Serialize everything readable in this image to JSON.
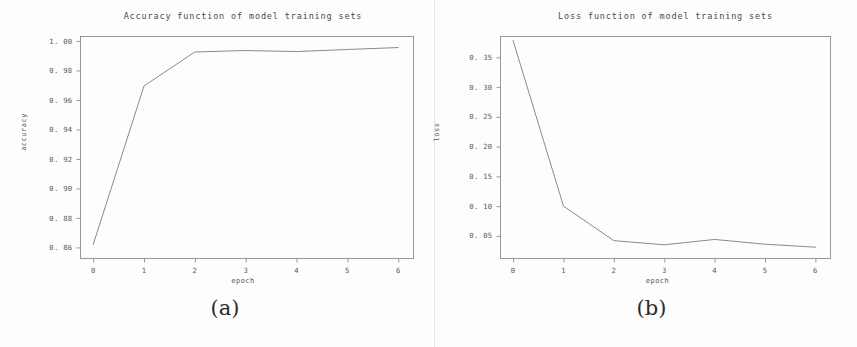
{
  "figure": {
    "background_color": "#fdfdfd",
    "line_color": "#8a8a8a",
    "axis_color": "#8e8e8e",
    "text_color": "#4a4a4a",
    "panels": [
      {
        "caption": "(a)"
      },
      {
        "caption": "(b)"
      }
    ]
  },
  "chart_data": [
    {
      "type": "line",
      "title": "Accuracy function of model training sets",
      "xlabel": "epoch",
      "ylabel": "accuracy",
      "x": [
        0,
        1,
        2,
        3,
        4,
        5,
        6
      ],
      "values": [
        0.862,
        0.9695,
        0.9925,
        0.9935,
        0.9928,
        0.9942,
        0.9955
      ],
      "series": [
        {
          "name": "accuracy",
          "values": [
            0.862,
            0.9695,
            0.9925,
            0.9935,
            0.9928,
            0.9942,
            0.9955
          ]
        }
      ],
      "xlim": [
        -0.25,
        6.3
      ],
      "ylim": [
        0.8525,
        1.003
      ],
      "xticks": [
        0,
        1,
        2,
        3,
        4,
        5,
        6
      ],
      "xtick_labels": [
        "0",
        "1",
        "2",
        "3",
        "4",
        "5",
        "6"
      ],
      "yticks": [
        0.86,
        0.88,
        0.9,
        0.92,
        0.94,
        0.96,
        0.98,
        1.0
      ],
      "ytick_labels": [
        "0. 86",
        "0. 88",
        "0. 90",
        "0. 92",
        "0. 94",
        "0. 96",
        "0. 98",
        "1. 00"
      ],
      "grid": false,
      "legend": null
    },
    {
      "type": "line",
      "title": "Loss function of model training sets",
      "xlabel": "epoch",
      "ylabel": "loss",
      "x": [
        0,
        1,
        2,
        3,
        4,
        5,
        6
      ],
      "values": [
        0.378,
        0.1,
        0.042,
        0.035,
        0.044,
        0.036,
        0.031
      ],
      "series": [
        {
          "name": "loss",
          "values": [
            0.378,
            0.1,
            0.042,
            0.035,
            0.044,
            0.036,
            0.031
          ]
        }
      ],
      "xlim": [
        -0.25,
        6.3
      ],
      "ylim": [
        0.012,
        0.385
      ],
      "xticks": [
        0,
        1,
        2,
        3,
        4,
        5,
        6
      ],
      "xtick_labels": [
        "0",
        "1",
        "2",
        "3",
        "4",
        "5",
        "6"
      ],
      "yticks": [
        0.05,
        0.1,
        0.15,
        0.2,
        0.25,
        0.3,
        0.35
      ],
      "ytick_labels": [
        "0. 05",
        "0. 10",
        "0. 15",
        "0. 20",
        "0. 25",
        "0. 30",
        "0. 35"
      ],
      "grid": false,
      "legend": null
    }
  ]
}
